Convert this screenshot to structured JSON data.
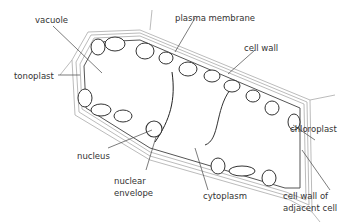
{
  "diagram": {
    "labels": {
      "vacuole": "vacuole",
      "plasma_membrane": "plasma membrane",
      "cell_wall": "cell wall",
      "tonoplast": "tonoplast",
      "chloroplast": "chloroplast",
      "nucleus": "nucleus",
      "nuclear_envelope_1": "nuclear",
      "nuclear_envelope_2": "envelope",
      "cytoplasm": "cytoplasm",
      "adjacent_wall_1": "cell wall of",
      "adjacent_wall_2": "adjacent cell"
    },
    "colors": {
      "line": "#333333",
      "wall": "#bbbbbb",
      "text": "#333333"
    }
  }
}
